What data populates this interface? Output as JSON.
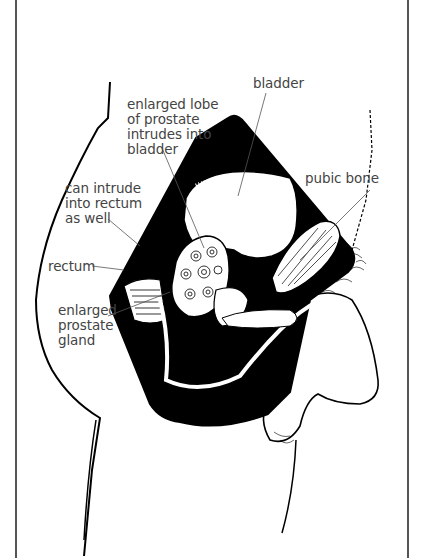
{
  "figure": {
    "labels": {
      "bladder": "bladder",
      "enlarged_lobe": "enlarged lobe\nof prostate\nintrudes into\nbladder",
      "pubic_bone": "pubic bone",
      "intrude_rectum": "can intrude\ninto rectum\nas well",
      "rectum": "rectum",
      "enlarged_gland": "enlarged\nprostate\ngland"
    },
    "colors": {
      "ink": "#000000",
      "label_text": "#444444",
      "frame": "#555555",
      "background": "#ffffff"
    }
  }
}
